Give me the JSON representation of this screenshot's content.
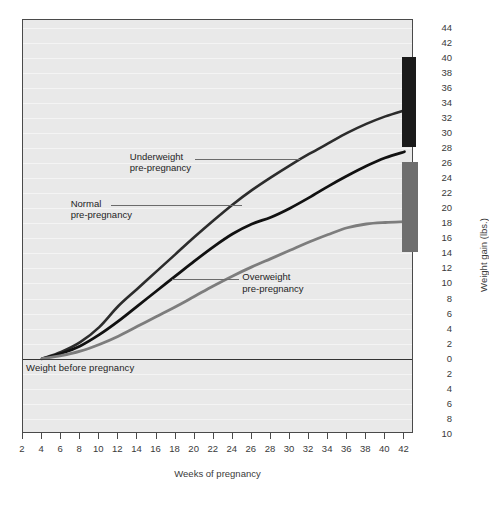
{
  "chart_data": {
    "type": "line",
    "title": "",
    "xlabel": "Weeks of pregnancy",
    "ylabel": "Weight gain (lbs.)",
    "xlim": [
      2,
      43
    ],
    "ylim": [
      -10,
      45
    ],
    "xticks": [
      2,
      4,
      6,
      8,
      10,
      12,
      14,
      16,
      18,
      20,
      22,
      24,
      26,
      28,
      30,
      32,
      34,
      36,
      38,
      40,
      42
    ],
    "yticks": [
      44,
      42,
      40,
      38,
      36,
      34,
      32,
      30,
      28,
      26,
      24,
      22,
      20,
      18,
      16,
      14,
      12,
      10,
      8,
      6,
      4,
      2,
      0,
      -2,
      -4,
      -6,
      -8,
      -10
    ],
    "ytick_labels": [
      "44",
      "42",
      "40",
      "38",
      "36",
      "34",
      "32",
      "30",
      "28",
      "26",
      "24",
      "22",
      "20",
      "18",
      "16",
      "14",
      "12",
      "10",
      "8",
      "6",
      "4",
      "2",
      "0",
      "2",
      "4",
      "6",
      "8",
      "10"
    ],
    "grid": true,
    "legend": "inline-callouts",
    "baseline": {
      "value": 0,
      "label": "Weight before pregnancy"
    },
    "x": [
      4,
      6,
      8,
      10,
      12,
      14,
      16,
      18,
      20,
      22,
      24,
      26,
      28,
      30,
      32,
      34,
      36,
      38,
      40,
      42
    ],
    "series": [
      {
        "name": "Underweight pre-pregnancy",
        "color": "#2c2c2c",
        "width": 2.6,
        "values": [
          0,
          0.9,
          2.2,
          4.2,
          7.0,
          9.3,
          11.6,
          13.9,
          16.2,
          18.4,
          20.5,
          22.4,
          24.1,
          25.7,
          27.2,
          28.6,
          30.0,
          31.2,
          32.2,
          33.0
        ]
      },
      {
        "name": "Normal pre-pregnancy",
        "color": "#111111",
        "width": 2.8,
        "values": [
          0,
          0.7,
          1.7,
          3.2,
          5.0,
          7.0,
          9.0,
          11.0,
          13.0,
          14.9,
          16.6,
          17.9,
          18.8,
          20.0,
          21.4,
          22.9,
          24.3,
          25.6,
          26.7,
          27.5
        ]
      },
      {
        "name": "Overweight pre-pregnancy",
        "color": "#7d7d7d",
        "width": 2.8,
        "values": [
          0,
          0.4,
          1.0,
          1.9,
          3.0,
          4.3,
          5.6,
          6.9,
          8.3,
          9.7,
          11.0,
          12.2,
          13.3,
          14.4,
          15.5,
          16.5,
          17.4,
          17.9,
          18.1,
          18.2
        ]
      }
    ],
    "range_bars": [
      {
        "name": "underweight-recommended-range",
        "color": "#1a1a1a",
        "low": 28,
        "high": 40
      },
      {
        "name": "normal-recommended-range",
        "color": "#6e6e6e",
        "low": 14,
        "high": 26
      }
    ],
    "annotations": [
      {
        "name": "underweight",
        "line1": "Underweight",
        "line2": "pre-pregnancy"
      },
      {
        "name": "normal",
        "line1": "Normal",
        "line2": "pre-pregnancy"
      },
      {
        "name": "overweight",
        "line1": "Overweight",
        "line2": "pre-pregnancy"
      }
    ]
  }
}
